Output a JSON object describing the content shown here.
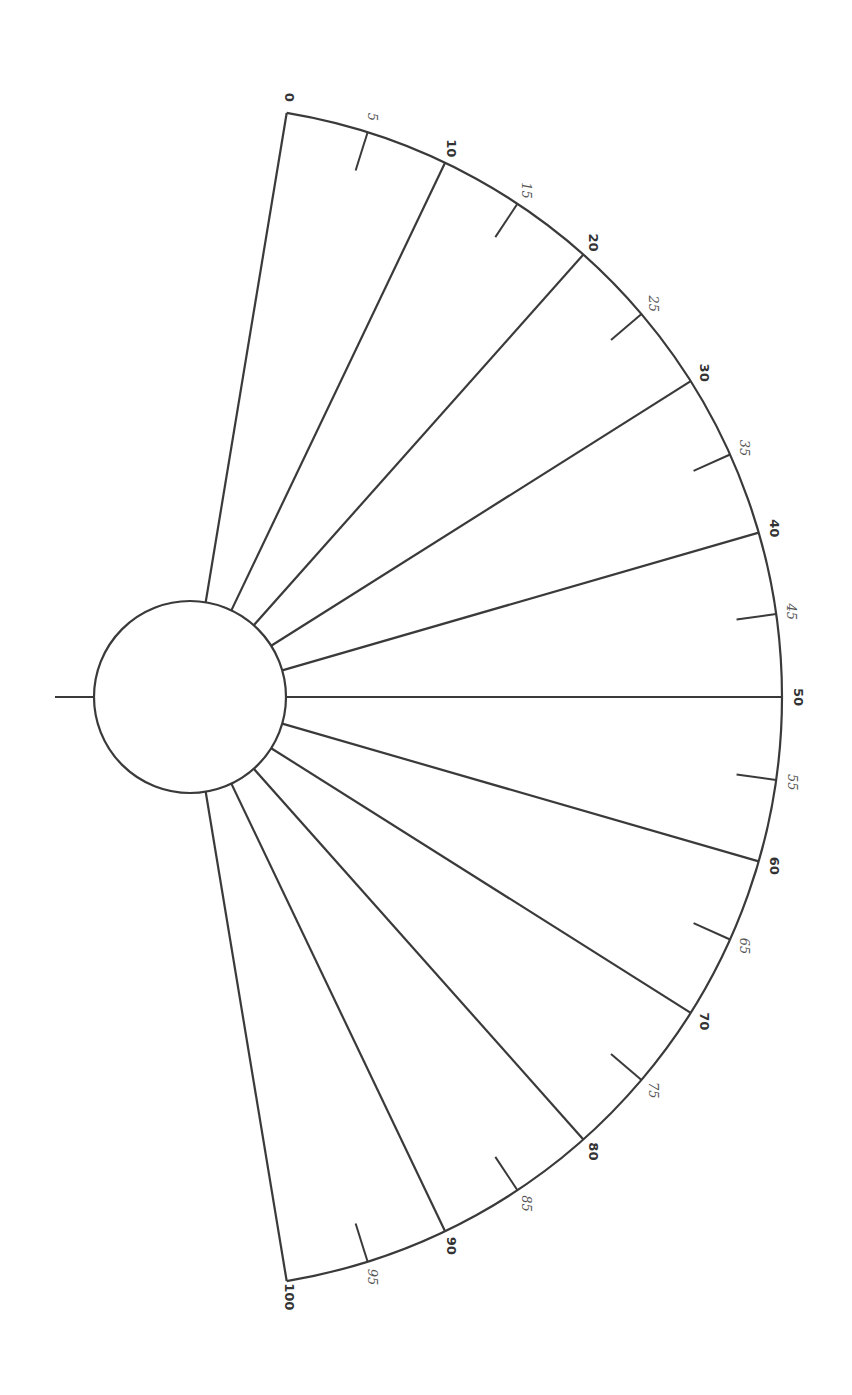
{
  "diagram": {
    "type": "semicircular-protractor-scale",
    "orientation": "rotated 90deg clockwise (scale reads top-to-bottom)",
    "colors": {
      "line": "#3a3a3a",
      "background": "#ffffff",
      "major_label": "#333333",
      "minor_label": "#555555"
    },
    "hub": {
      "cx": 190,
      "cy": 697,
      "r": 96,
      "pointer_tick": {
        "x1": 55,
        "x2": 94
      }
    },
    "arc": {
      "radius": 592,
      "start_angle_deg": -80.6,
      "end_angle_deg": 80.6
    },
    "major_ticks": [
      {
        "value": 0,
        "label": "0"
      },
      {
        "value": 10,
        "label": "10"
      },
      {
        "value": 20,
        "label": "20"
      },
      {
        "value": 30,
        "label": "30"
      },
      {
        "value": 40,
        "label": "40"
      },
      {
        "value": 50,
        "label": "50"
      },
      {
        "value": 60,
        "label": "60"
      },
      {
        "value": 70,
        "label": "70"
      },
      {
        "value": 80,
        "label": "80"
      },
      {
        "value": 90,
        "label": "90"
      },
      {
        "value": 100,
        "label": "100"
      }
    ],
    "minor_ticks": [
      {
        "value": 5,
        "label": "5"
      },
      {
        "value": 15,
        "label": "15"
      },
      {
        "value": 25,
        "label": "25"
      },
      {
        "value": 35,
        "label": "35"
      },
      {
        "value": 45,
        "label": "45"
      },
      {
        "value": 55,
        "label": "55"
      },
      {
        "value": 65,
        "label": "65"
      },
      {
        "value": 75,
        "label": "75"
      },
      {
        "value": 85,
        "label": "85"
      },
      {
        "value": 95,
        "label": "95"
      }
    ],
    "minor_tick_length": 40
  }
}
